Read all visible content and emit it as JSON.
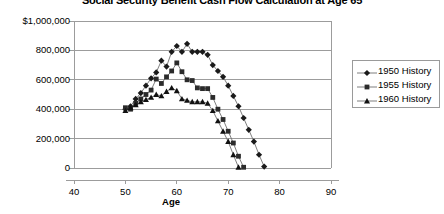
{
  "chart_data": {
    "type": "line",
    "title": "Social Security Benefit Cash Flow Calculation at Age 65",
    "xlabel": "Age",
    "ylabel": "",
    "xlim": [
      40,
      90
    ],
    "ylim": [
      0,
      1000000
    ],
    "xticks": [
      40,
      50,
      60,
      70,
      80,
      90
    ],
    "yticks": [
      0,
      200000,
      400000,
      600000,
      800000,
      1000000
    ],
    "ytick_labels": [
      "0",
      "200,000",
      "400,000",
      "600,000",
      "800,000",
      "$1,000,000"
    ],
    "xtick_labels": [
      "40",
      "50",
      "60",
      "70",
      "80",
      "90"
    ],
    "grid": true,
    "legend_position": "right",
    "series": [
      {
        "name": "1950 History",
        "marker": "diamond",
        "color": "#1a1a1a",
        "x": [
          50,
          51,
          52,
          53,
          54,
          55,
          56,
          57,
          58,
          59,
          60,
          61,
          62,
          63,
          64,
          65,
          66,
          67,
          68,
          69,
          70,
          71,
          72,
          73,
          74,
          75,
          76,
          77
        ],
        "y": [
          400000,
          420000,
          470000,
          510000,
          560000,
          610000,
          650000,
          730000,
          690000,
          790000,
          830000,
          790000,
          845000,
          790000,
          790000,
          790000,
          770000,
          700000,
          660000,
          620000,
          560000,
          490000,
          420000,
          340000,
          260000,
          180000,
          90000,
          10000
        ]
      },
      {
        "name": "1955 History",
        "marker": "square",
        "color": "#2b2b2b",
        "x": [
          50,
          51,
          52,
          53,
          54,
          55,
          56,
          57,
          58,
          59,
          60,
          61,
          62,
          63,
          64,
          65,
          66,
          67,
          68,
          69,
          70,
          71,
          72,
          73
        ],
        "y": [
          410000,
          400000,
          440000,
          470000,
          500000,
          530000,
          605000,
          575000,
          620000,
          660000,
          715000,
          655000,
          600000,
          595000,
          545000,
          540000,
          540000,
          480000,
          400000,
          330000,
          250000,
          170000,
          80000,
          5000
        ]
      },
      {
        "name": "1960 History",
        "marker": "triangle",
        "color": "#111111",
        "x": [
          50,
          51,
          52,
          53,
          54,
          55,
          56,
          57,
          58,
          59,
          60,
          61,
          62,
          63,
          64,
          65,
          66,
          67,
          68,
          69,
          70,
          71,
          72
        ],
        "y": [
          390000,
          410000,
          430000,
          450000,
          465000,
          480000,
          500000,
          490000,
          520000,
          545000,
          525000,
          470000,
          460000,
          450000,
          450000,
          450000,
          440000,
          390000,
          320000,
          250000,
          180000,
          90000,
          5000
        ]
      }
    ]
  }
}
